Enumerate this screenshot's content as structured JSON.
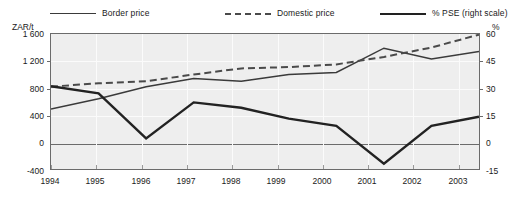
{
  "legend": {
    "items": [
      {
        "label": "Border price",
        "style": "solid-thin",
        "color": "#3a3a3a",
        "name": "legend-border-price"
      },
      {
        "label": "Domestic price",
        "style": "dashed",
        "color": "#4a4a4a",
        "name": "legend-domestic-price"
      },
      {
        "label": "% PSE (right scale)",
        "style": "solid-thick",
        "color": "#222222",
        "name": "legend-pse"
      }
    ]
  },
  "axes": {
    "left_unit": "ZAR/t",
    "right_unit": "%",
    "left_ticks": [
      "1 600",
      "1 200",
      "800",
      "400",
      "0",
      "-400"
    ],
    "right_ticks": [
      "60",
      "45",
      "30",
      "15",
      "0",
      "-15"
    ],
    "x_ticks": [
      "1994",
      "1995",
      "1996",
      "1997",
      "1998",
      "1999",
      "2000",
      "2001",
      "2002",
      "2003"
    ]
  },
  "chart_data": {
    "type": "line",
    "title": "",
    "xlabel": "",
    "ylabel": "ZAR/t",
    "y2label": "%",
    "categories": [
      "1994",
      "1995",
      "1996",
      "1997",
      "1998",
      "1999",
      "2000",
      "2001",
      "2002",
      "2003"
    ],
    "ylim": [
      -400,
      1600
    ],
    "y2lim": [
      -15,
      60
    ],
    "yticks": [
      -400,
      0,
      400,
      800,
      1200,
      1600
    ],
    "y2ticks": [
      -15,
      0,
      15,
      30,
      45,
      60
    ],
    "grid": true,
    "legend_position": "top",
    "series": [
      {
        "name": "Border price",
        "axis": "left",
        "style": "solid-thin",
        "color": "#3a3a3a",
        "values": [
          490,
          640,
          820,
          940,
          900,
          1000,
          1030,
          1390,
          1230,
          1340
        ]
      },
      {
        "name": "Domestic price",
        "axis": "left",
        "style": "dashed",
        "color": "#4a4a4a",
        "values": [
          820,
          870,
          900,
          1000,
          1090,
          1110,
          1150,
          1260,
          1400,
          1590
        ]
      },
      {
        "name": "% PSE (right scale)",
        "axis": "right",
        "style": "solid-thick",
        "color": "#222222",
        "values": [
          31,
          27,
          2,
          22,
          19,
          13,
          9,
          -12,
          9,
          14
        ]
      }
    ]
  }
}
